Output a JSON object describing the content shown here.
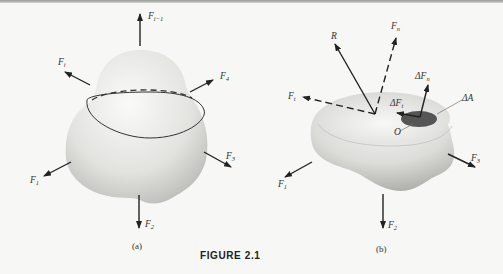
{
  "figure": {
    "caption": "FIGURE 2.1",
    "panels": [
      {
        "id": "a",
        "label": "(a)",
        "forces": [
          {
            "name": "F",
            "sub": "i−1"
          },
          {
            "name": "F",
            "sub": "i"
          },
          {
            "name": "F",
            "sub": "4"
          },
          {
            "name": "F",
            "sub": "1"
          },
          {
            "name": "F",
            "sub": "3"
          },
          {
            "name": "F",
            "sub": "2"
          }
        ]
      },
      {
        "id": "b",
        "label": "(b)",
        "forces": [
          {
            "name": "R",
            "sub": ""
          },
          {
            "name": "F",
            "sub": "n"
          },
          {
            "name": "F",
            "sub": "t"
          },
          {
            "name": "ΔF",
            "sub": "n"
          },
          {
            "name": "ΔF",
            "sub": "t"
          },
          {
            "name": "ΔA",
            "sub": ""
          },
          {
            "name": "O",
            "sub": ""
          },
          {
            "name": "F",
            "sub": "1"
          },
          {
            "name": "F",
            "sub": "3"
          },
          {
            "name": "F",
            "sub": "2"
          }
        ]
      }
    ]
  },
  "colors": {
    "background": "#f7f7f5",
    "ink": "#222222",
    "body_light": "#f0f0ee",
    "body_shadow": "#b8b8b5",
    "patch": "#555555"
  }
}
